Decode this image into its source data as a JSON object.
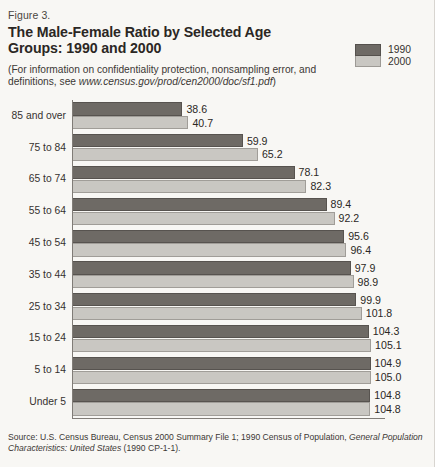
{
  "header": {
    "figure_number": "Figure 3.",
    "title": "The Male-Female Ratio by Selected Age Groups: 1990 and 2000",
    "subtitle_pre": "(For information on confidentiality protection, nonsampling error, and definitions, see ",
    "subtitle_url": "www.census.gov/prod/cen2000/doc/sf1.pdf",
    "subtitle_post": ")"
  },
  "legend": {
    "items": [
      {
        "label": "1990",
        "color": "#6e6a65"
      },
      {
        "label": "2000",
        "color": "#c9c7c2"
      }
    ]
  },
  "footer": {
    "source_pre": "Source: U.S. Census Bureau, Census 2000 Summary File 1; 1990 Census of Population, ",
    "source_italic": "General Population Characteristics:  United States",
    "source_post": " (1990 CP-1-1)."
  },
  "chart_data": {
    "type": "bar",
    "orientation": "horizontal",
    "title": "The Male-Female Ratio by Selected Age Groups: 1990 and 2000",
    "xlabel": "",
    "ylabel": "",
    "xlim": [
      0,
      110
    ],
    "grid": false,
    "legend_position": "top-right",
    "categories": [
      "85 and over",
      "75 to 84",
      "65 to 74",
      "55 to 64",
      "45 to 54",
      "35 to 44",
      "25 to 34",
      "15 to 24",
      "5 to 14",
      "Under 5"
    ],
    "series": [
      {
        "name": "1990",
        "color": "#6e6a65",
        "values": [
          38.6,
          59.9,
          78.1,
          89.4,
          95.6,
          97.9,
          99.9,
          104.3,
          104.9,
          104.8
        ]
      },
      {
        "name": "2000",
        "color": "#c9c7c2",
        "values": [
          40.7,
          65.2,
          82.3,
          92.2,
          96.4,
          98.9,
          101.8,
          105.1,
          105.0,
          104.8
        ]
      }
    ]
  }
}
